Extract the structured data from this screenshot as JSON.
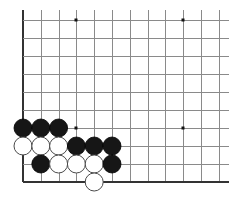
{
  "board": {
    "description": "Go (Weiqi/Baduk) board fragment showing the lower-left corner region",
    "visible_columns": 12,
    "visible_rows": 10,
    "origin": {
      "x": 23,
      "y": 20
    },
    "spacing": {
      "x": 17.8,
      "y": 18
    },
    "line_extent": {
      "top": 10,
      "right": 229
    },
    "edges": [
      "left",
      "bottom"
    ],
    "colors": {
      "grid_line": "#8a8a8a",
      "edge_line": "#333333",
      "black_stone": "#161616",
      "white_stone": "#ffffff",
      "white_stone_outline": "#4a4a4a",
      "background": "#ffffff"
    },
    "stone_radius": 9,
    "hoshi_points": [
      {
        "col": 3,
        "row": 0
      },
      {
        "col": 9,
        "row": 0
      },
      {
        "col": 3,
        "row": 6
      },
      {
        "col": 9,
        "row": 6
      }
    ],
    "stones": [
      {
        "color": "black",
        "col": 0,
        "row": 6
      },
      {
        "color": "black",
        "col": 1,
        "row": 6
      },
      {
        "color": "black",
        "col": 2,
        "row": 6
      },
      {
        "color": "white",
        "col": 0,
        "row": 7
      },
      {
        "color": "white",
        "col": 1,
        "row": 7
      },
      {
        "color": "white",
        "col": 2,
        "row": 7
      },
      {
        "color": "black",
        "col": 3,
        "row": 7
      },
      {
        "color": "black",
        "col": 4,
        "row": 7
      },
      {
        "color": "black",
        "col": 5,
        "row": 7
      },
      {
        "color": "black",
        "col": 1,
        "row": 8
      },
      {
        "color": "white",
        "col": 2,
        "row": 8
      },
      {
        "color": "white",
        "col": 3,
        "row": 8
      },
      {
        "color": "white",
        "col": 4,
        "row": 8
      },
      {
        "color": "black",
        "col": 5,
        "row": 8
      },
      {
        "color": "white",
        "col": 4,
        "row": 9
      }
    ]
  }
}
